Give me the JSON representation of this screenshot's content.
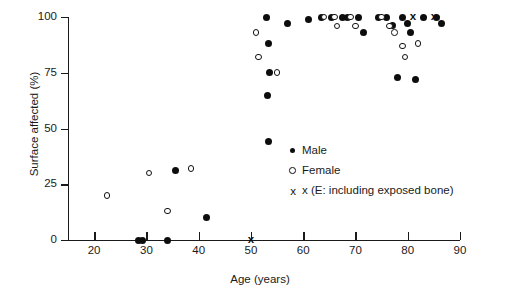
{
  "chart_data": {
    "type": "scatter",
    "title": "",
    "xlabel": "Age (years)",
    "ylabel": "Surface affected (%)",
    "xlim": [
      15,
      90
    ],
    "ylim": [
      0,
      100
    ],
    "grid": false,
    "legend_position": "inside-right",
    "xticks": [
      20,
      30,
      40,
      50,
      60,
      70,
      80,
      90
    ],
    "yticks": [
      0,
      25,
      50,
      75,
      100
    ],
    "series": [
      {
        "name": "Male",
        "marker": "filled-circle",
        "color": "#0d0d0d",
        "points": [
          [
            28.5,
            0
          ],
          [
            29.2,
            0
          ],
          [
            34.0,
            0
          ],
          [
            35.5,
            31
          ],
          [
            41.5,
            10
          ],
          [
            53.0,
            100
          ],
          [
            53.3,
            88
          ],
          [
            53.6,
            75
          ],
          [
            53.2,
            65
          ],
          [
            53.4,
            44
          ],
          [
            57.0,
            97
          ],
          [
            61.0,
            99
          ],
          [
            63.5,
            100
          ],
          [
            65.5,
            100
          ],
          [
            67.5,
            100
          ],
          [
            68.5,
            100
          ],
          [
            70.5,
            100
          ],
          [
            71.5,
            93
          ],
          [
            74.5,
            100
          ],
          [
            76.0,
            100
          ],
          [
            77.0,
            96
          ],
          [
            78.0,
            73
          ],
          [
            79.0,
            100
          ],
          [
            80.0,
            97
          ],
          [
            80.5,
            93
          ],
          [
            81.5,
            72
          ],
          [
            83.0,
            100
          ],
          [
            85.5,
            100
          ],
          [
            86.5,
            97
          ]
        ]
      },
      {
        "name": "Female",
        "marker": "open-circle",
        "color": "#111111",
        "points": [
          [
            22.5,
            20
          ],
          [
            30.5,
            30
          ],
          [
            34.0,
            13
          ],
          [
            38.5,
            32
          ],
          [
            51.0,
            93
          ],
          [
            51.5,
            82
          ],
          [
            55.0,
            75
          ],
          [
            64.0,
            100
          ],
          [
            66.0,
            100
          ],
          [
            66.5,
            96
          ],
          [
            69.0,
            100
          ],
          [
            70.0,
            96
          ],
          [
            75.0,
            100
          ],
          [
            76.5,
            96
          ],
          [
            77.5,
            93
          ],
          [
            79.0,
            87
          ],
          [
            79.5,
            82
          ],
          [
            82.0,
            88
          ]
        ]
      },
      {
        "name": "x (E: including exposed bone)",
        "marker": "x",
        "color": "#0d0d0d",
        "points": [
          [
            50.0,
            0
          ],
          [
            81.0,
            100
          ],
          [
            85.0,
            100
          ]
        ]
      }
    ]
  },
  "axes": {
    "y_title": "Surface affected (%)",
    "x_title": "Age (years)",
    "y_ticks": [
      "100",
      "75",
      "50",
      "25",
      "0"
    ],
    "x_ticks": [
      "20",
      "30",
      "40",
      "50",
      "60",
      "70",
      "80",
      "90"
    ]
  },
  "legend": {
    "items": [
      {
        "label": "Male",
        "key": "filled-circle-icon"
      },
      {
        "label": "Female",
        "key": "open-circle-icon"
      },
      {
        "label": "x (E: including exposed bone)",
        "key": "x-marker-icon"
      }
    ]
  }
}
